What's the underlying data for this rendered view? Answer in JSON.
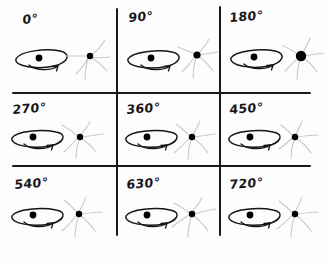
{
  "figure": {
    "kind": "hand-drawn-sketch",
    "title": "",
    "background_color": "#fdfdfd",
    "ink_color": "#1a1a1a",
    "faint_ink_color": "#c9c9cc",
    "grid": {
      "rows": 3,
      "columns": 3,
      "line_color": "#1a1a1a",
      "vertical_lines_x": [
        116,
        219
      ],
      "horizontal_lines_y": [
        92,
        165
      ]
    }
  },
  "cells": [
    {
      "id": "cell-0",
      "label": "0°",
      "angle_degrees": 0,
      "disc": {
        "name": "spinning-disc",
        "center_dot": true,
        "rotation_arrow": true
      },
      "star": {
        "name": "star-sparkle",
        "dot_size": "small"
      }
    },
    {
      "id": "cell-90",
      "label": "90°",
      "angle_degrees": 90,
      "disc": {
        "name": "spinning-disc",
        "center_dot": true,
        "rotation_arrow": true
      },
      "star": {
        "name": "star-sparkle",
        "dot_size": "medium"
      }
    },
    {
      "id": "cell-180",
      "label": "180°",
      "angle_degrees": 180,
      "disc": {
        "name": "spinning-disc",
        "center_dot": true,
        "rotation_arrow": true
      },
      "star": {
        "name": "star-sparkle",
        "dot_size": "large"
      }
    },
    {
      "id": "cell-270",
      "label": "270°",
      "angle_degrees": 270,
      "disc": {
        "name": "spinning-disc",
        "center_dot": true,
        "rotation_arrow": true
      },
      "star": {
        "name": "star-sparkle",
        "dot_size": "small"
      }
    },
    {
      "id": "cell-360",
      "label": "360°",
      "angle_degrees": 360,
      "disc": {
        "name": "spinning-disc",
        "center_dot": true,
        "rotation_arrow": true
      },
      "star": {
        "name": "star-sparkle",
        "dot_size": "small"
      }
    },
    {
      "id": "cell-450",
      "label": "450°",
      "angle_degrees": 450,
      "disc": {
        "name": "spinning-disc",
        "center_dot": true,
        "rotation_arrow": true
      },
      "star": {
        "name": "star-sparkle",
        "dot_size": "small"
      }
    },
    {
      "id": "cell-540",
      "label": "540°",
      "angle_degrees": 540,
      "disc": {
        "name": "spinning-disc",
        "center_dot": true,
        "rotation_arrow": true
      },
      "star": {
        "name": "star-sparkle",
        "dot_size": "small"
      }
    },
    {
      "id": "cell-630",
      "label": "630°",
      "angle_degrees": 630,
      "disc": {
        "name": "spinning-disc",
        "center_dot": true,
        "rotation_arrow": true
      },
      "star": {
        "name": "star-sparkle",
        "dot_size": "small"
      }
    },
    {
      "id": "cell-720",
      "label": "720°",
      "angle_degrees": 720,
      "disc": {
        "name": "spinning-disc",
        "center_dot": true,
        "rotation_arrow": true
      },
      "star": {
        "name": "star-sparkle",
        "dot_size": "small"
      }
    }
  ]
}
